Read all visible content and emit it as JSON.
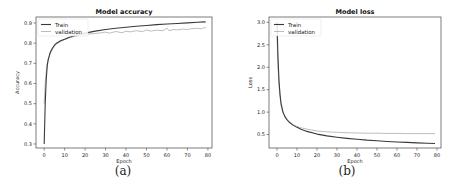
{
  "figure": {
    "panels": [
      {
        "caption": "(a)"
      },
      {
        "caption": "(b)"
      }
    ]
  },
  "chart_data": [
    {
      "type": "line",
      "title": "Model accuracy",
      "xlabel": "Epoch",
      "ylabel": "Accuracy",
      "xlim": [
        -4,
        82
      ],
      "ylim": [
        0.28,
        0.93
      ],
      "xticks": [
        0,
        10,
        20,
        30,
        40,
        50,
        60,
        70,
        80
      ],
      "yticks": [
        0.3,
        0.4,
        0.5,
        0.6,
        0.7,
        0.8,
        0.9
      ],
      "grid": false,
      "legend_position": "upper left",
      "colors": {
        "Train": "#3a3a3a",
        "validation": "#b5b5b5"
      },
      "series": [
        {
          "name": "Train",
          "x": [
            0,
            0.5,
            1,
            1.5,
            2,
            3,
            4,
            5,
            6,
            8,
            10,
            12,
            15,
            20,
            25,
            30,
            35,
            40,
            45,
            50,
            55,
            60,
            65,
            70,
            75,
            78,
            79
          ],
          "y": [
            0.3,
            0.5,
            0.62,
            0.69,
            0.72,
            0.755,
            0.775,
            0.79,
            0.8,
            0.812,
            0.82,
            0.828,
            0.838,
            0.85,
            0.86,
            0.868,
            0.874,
            0.879,
            0.884,
            0.888,
            0.892,
            0.895,
            0.898,
            0.901,
            0.904,
            0.906,
            0.905
          ]
        },
        {
          "name": "validation",
          "x": [
            0,
            0.5,
            1,
            1.5,
            2,
            3,
            4,
            5,
            6,
            8,
            10,
            12,
            15,
            18,
            20,
            22,
            25,
            28,
            30,
            32,
            35,
            38,
            40,
            42,
            45,
            48,
            50,
            52,
            55,
            58,
            60,
            61,
            63,
            65,
            68,
            70,
            72,
            75,
            77,
            78,
            79
          ],
          "y": [
            0.5,
            0.6,
            0.66,
            0.7,
            0.72,
            0.75,
            0.77,
            0.785,
            0.795,
            0.808,
            0.818,
            0.826,
            0.834,
            0.84,
            0.843,
            0.846,
            0.848,
            0.852,
            0.855,
            0.85,
            0.858,
            0.852,
            0.86,
            0.856,
            0.862,
            0.857,
            0.866,
            0.86,
            0.865,
            0.862,
            0.875,
            0.862,
            0.868,
            0.866,
            0.87,
            0.868,
            0.872,
            0.874,
            0.871,
            0.877,
            0.876
          ]
        }
      ]
    },
    {
      "type": "line",
      "title": "Model loss",
      "xlabel": "Epoch",
      "ylabel": "Loss",
      "xlim": [
        -4,
        82
      ],
      "ylim": [
        0.2,
        3.12
      ],
      "xticks": [
        0,
        10,
        20,
        30,
        40,
        50,
        60,
        70,
        80
      ],
      "yticks": [
        0.5,
        1.0,
        1.5,
        2.0,
        2.5,
        3.0
      ],
      "grid": false,
      "legend_position": "upper left",
      "colors": {
        "Train": "#3a3a3a",
        "validation": "#b5b5b5"
      },
      "series": [
        {
          "name": "Train",
          "x": [
            0,
            0.5,
            1,
            1.5,
            2,
            3,
            4,
            5,
            6,
            8,
            10,
            12,
            15,
            20,
            25,
            30,
            35,
            40,
            45,
            50,
            55,
            60,
            65,
            70,
            75,
            79
          ],
          "y": [
            3.0,
            2.2,
            1.7,
            1.4,
            1.2,
            1.0,
            0.9,
            0.83,
            0.78,
            0.71,
            0.66,
            0.62,
            0.57,
            0.51,
            0.47,
            0.44,
            0.415,
            0.395,
            0.375,
            0.36,
            0.345,
            0.335,
            0.325,
            0.315,
            0.305,
            0.3
          ]
        },
        {
          "name": "validation",
          "x": [
            0,
            0.5,
            1,
            1.5,
            2,
            3,
            4,
            5,
            6,
            8,
            10,
            12,
            15,
            20,
            25,
            30,
            35,
            40,
            45,
            50,
            55,
            60,
            65,
            70,
            75,
            79
          ],
          "y": [
            2.7,
            2.0,
            1.6,
            1.35,
            1.15,
            0.98,
            0.88,
            0.82,
            0.78,
            0.72,
            0.68,
            0.65,
            0.62,
            0.58,
            0.56,
            0.55,
            0.54,
            0.535,
            0.53,
            0.53,
            0.525,
            0.525,
            0.52,
            0.52,
            0.52,
            0.52
          ]
        }
      ]
    }
  ]
}
